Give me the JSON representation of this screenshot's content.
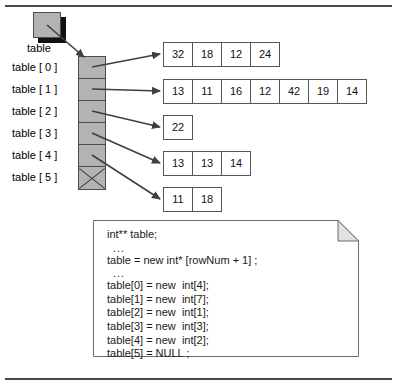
{
  "figure": {
    "root_pointer": {
      "label": "table"
    },
    "index_labels": [
      "table [ 0 ]",
      "table [ 1 ]",
      "table [ 2 ]",
      "table [ 3 ]",
      "table [ 4 ]",
      "table [ 5 ]"
    ],
    "pointer_cells": [
      {
        "index": 0,
        "null": false
      },
      {
        "index": 1,
        "null": false
      },
      {
        "index": 2,
        "null": false
      },
      {
        "index": 3,
        "null": false
      },
      {
        "index": 4,
        "null": false
      },
      {
        "index": 5,
        "null": true
      }
    ],
    "arrays": [
      {
        "row": 0,
        "values": [
          "32",
          "18",
          "12",
          "24"
        ]
      },
      {
        "row": 1,
        "values": [
          "13",
          "11",
          "16",
          "12",
          "42",
          "19",
          "14"
        ]
      },
      {
        "row": 2,
        "values": [
          "22"
        ]
      },
      {
        "row": 3,
        "values": [
          "13",
          "13",
          "14"
        ]
      },
      {
        "row": 4,
        "values": [
          "11",
          "18"
        ]
      }
    ],
    "note": {
      "lines": [
        "int** table;",
        "...",
        "table = new int* [rowNum + 1] ;",
        "...",
        "table[0] = new  int[4];",
        "table[1] = new  int[7];",
        "table[2] = new  int[1];",
        "table[3] = new  int[3];",
        "table[4] = new  int[2];",
        "table[5] = NULL ;"
      ]
    },
    "colors": {
      "pointer_fill": "#b3b3b3",
      "pointer_border": "#4c4c4c",
      "cell_border": "#555555",
      "arrow": "#3f3f3f",
      "rule": "#4a4a4a",
      "shadow": "#111111"
    }
  }
}
